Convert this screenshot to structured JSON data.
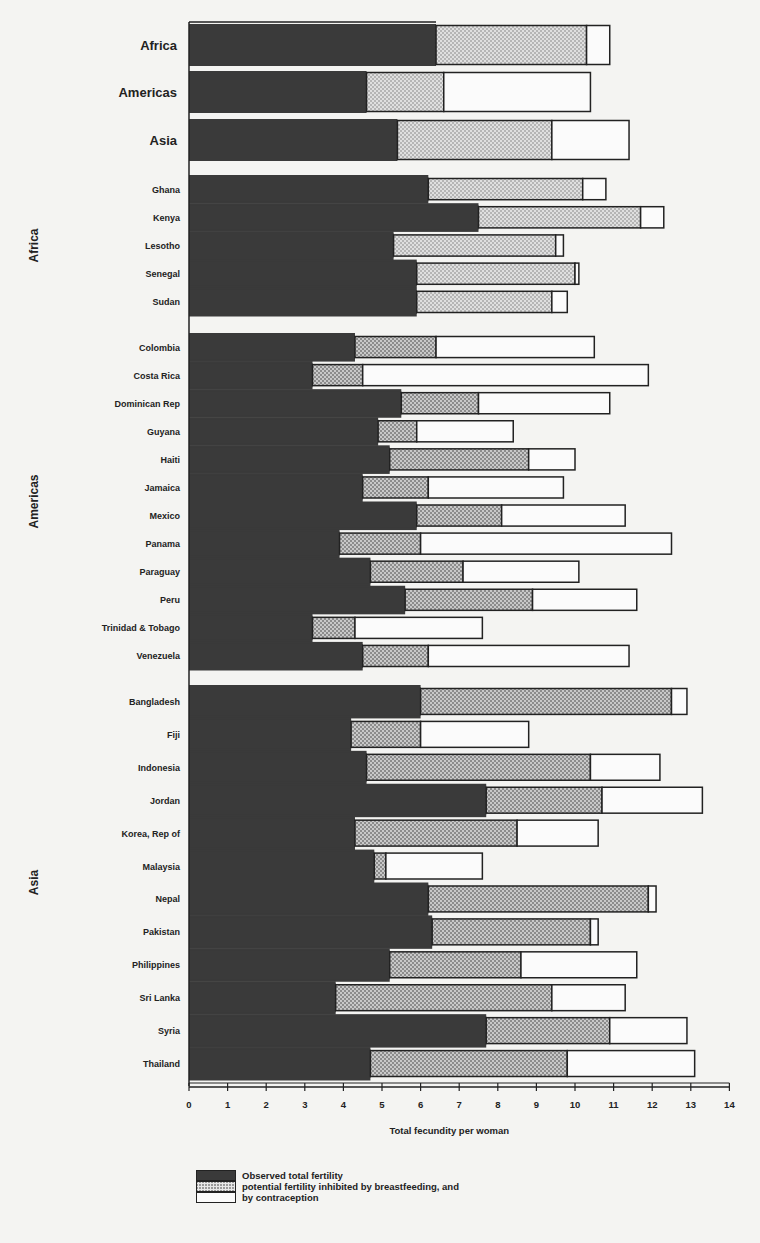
{
  "chart_data": {
    "type": "bar",
    "orientation": "horizontal",
    "stacked": true,
    "title": "",
    "xlabel": "Total fecundity per woman",
    "ylabel": "",
    "xlim": [
      0,
      14
    ],
    "xticks": [
      0,
      1,
      2,
      3,
      4,
      5,
      6,
      7,
      8,
      9,
      10,
      11,
      12,
      13,
      14
    ],
    "grid": false,
    "legend": {
      "position": "bottom",
      "entries": [
        "Observed total fertility",
        "potential fertility inhibited by breastfeeding, and",
        "by contraception"
      ]
    },
    "series_names": [
      "Observed total fertility",
      "Inhibited by breastfeeding",
      "Inhibited by contraception"
    ],
    "note": "values are cumulative right-edge positions of each segment (fertility, fertility+breastfeeding, total fecundity)",
    "summary": [
      {
        "region": "Africa",
        "fertility": 6.4,
        "breastfeeding_end": 10.3,
        "total": 10.9
      },
      {
        "region": "Americas",
        "fertility": 4.6,
        "breastfeeding_end": 6.6,
        "total": 10.4
      },
      {
        "region": "Asia",
        "fertility": 5.4,
        "breastfeeding_end": 9.4,
        "total": 11.4
      }
    ],
    "groups": [
      {
        "region": "Africa",
        "countries": [
          {
            "name": "Ghana",
            "fertility": 6.2,
            "breastfeeding_end": 10.2,
            "total": 10.8
          },
          {
            "name": "Kenya",
            "fertility": 7.5,
            "breastfeeding_end": 11.7,
            "total": 12.3
          },
          {
            "name": "Lesotho",
            "fertility": 5.3,
            "breastfeeding_end": 9.5,
            "total": 9.7
          },
          {
            "name": "Senegal",
            "fertility": 5.9,
            "breastfeeding_end": 10.0,
            "total": 10.1
          },
          {
            "name": "Sudan",
            "fertility": 5.9,
            "breastfeeding_end": 9.4,
            "total": 9.8
          }
        ]
      },
      {
        "region": "Americas",
        "countries": [
          {
            "name": "Colombia",
            "fertility": 4.3,
            "breastfeeding_end": 6.4,
            "total": 10.5
          },
          {
            "name": "Costa Rica",
            "fertility": 3.2,
            "breastfeeding_end": 4.5,
            "total": 11.9
          },
          {
            "name": "Dominican Rep",
            "fertility": 5.5,
            "breastfeeding_end": 7.5,
            "total": 10.9
          },
          {
            "name": "Guyana",
            "fertility": 4.9,
            "breastfeeding_end": 5.9,
            "total": 8.4
          },
          {
            "name": "Haiti",
            "fertility": 5.2,
            "breastfeeding_end": 8.8,
            "total": 10.0
          },
          {
            "name": "Jamaica",
            "fertility": 4.5,
            "breastfeeding_end": 6.2,
            "total": 9.7
          },
          {
            "name": "Mexico",
            "fertility": 5.9,
            "breastfeeding_end": 8.1,
            "total": 11.3
          },
          {
            "name": "Panama",
            "fertility": 3.9,
            "breastfeeding_end": 6.0,
            "total": 12.5
          },
          {
            "name": "Paraguay",
            "fertility": 4.7,
            "breastfeeding_end": 7.1,
            "total": 10.1
          },
          {
            "name": "Peru",
            "fertility": 5.6,
            "breastfeeding_end": 8.9,
            "total": 11.6
          },
          {
            "name": "Trinidad & Tobago",
            "fertility": 3.2,
            "breastfeeding_end": 4.3,
            "total": 7.6
          },
          {
            "name": "Venezuela",
            "fertility": 4.5,
            "breastfeeding_end": 6.2,
            "total": 11.4
          }
        ]
      },
      {
        "region": "Asia",
        "countries": [
          {
            "name": "Bangladesh",
            "fertility": 6.0,
            "breastfeeding_end": 12.5,
            "total": 12.9
          },
          {
            "name": "Fiji",
            "fertility": 4.2,
            "breastfeeding_end": 6.0,
            "total": 8.8
          },
          {
            "name": "Indonesia",
            "fertility": 4.6,
            "breastfeeding_end": 10.4,
            "total": 12.2
          },
          {
            "name": "Jordan",
            "fertility": 7.7,
            "breastfeeding_end": 10.7,
            "total": 13.3
          },
          {
            "name": "Korea, Rep of",
            "fertility": 4.3,
            "breastfeeding_end": 8.5,
            "total": 10.6
          },
          {
            "name": "Malaysia",
            "fertility": 4.8,
            "breastfeeding_end": 5.1,
            "total": 7.6
          },
          {
            "name": "Nepal",
            "fertility": 6.2,
            "breastfeeding_end": 11.9,
            "total": 12.1
          },
          {
            "name": "Pakistan",
            "fertility": 6.3,
            "breastfeeding_end": 10.4,
            "total": 10.6
          },
          {
            "name": "Philippines",
            "fertility": 5.2,
            "breastfeeding_end": 8.6,
            "total": 11.6
          },
          {
            "name": "Sri Lanka",
            "fertility": 3.8,
            "breastfeeding_end": 9.4,
            "total": 11.3
          },
          {
            "name": "Syria",
            "fertility": 7.7,
            "breastfeeding_end": 10.9,
            "total": 12.9
          },
          {
            "name": "Thailand",
            "fertility": 4.7,
            "breastfeeding_end": 9.8,
            "total": 13.1
          }
        ]
      }
    ]
  },
  "colors": {
    "fertility": "#3a3a3a",
    "breastfeeding": "#9a9a9a",
    "contraception": "#fbfbfb",
    "outline": "#222222"
  },
  "legend": {
    "fertility_label": "Observed total fertility",
    "breastfeeding_label": "potential fertility inhibited by breastfeeding, and",
    "contraception_label": "by contraception"
  },
  "axis": {
    "xlabel": "Total fecundity per woman"
  }
}
